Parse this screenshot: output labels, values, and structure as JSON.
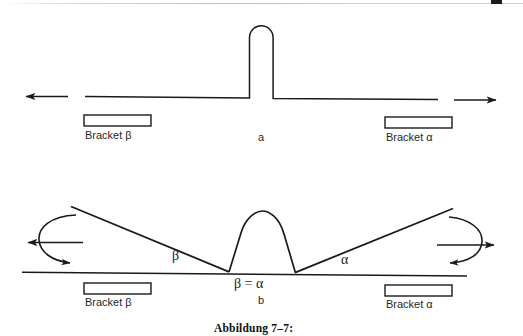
{
  "figure": {
    "caption": "Abbildung 7–7:",
    "panels": [
      {
        "id": "a",
        "letter": "a",
        "bracket_left_label": "Bracket β",
        "bracket_right_label": "Bracket α"
      },
      {
        "id": "b",
        "letter": "b",
        "bracket_left_label": "Bracket β",
        "bracket_right_label": "Bracket α",
        "angle_left_label": "β",
        "angle_right_label": "α",
        "equality_label": "β = α"
      }
    ],
    "colors": {
      "ink": "#1a1a1a",
      "paper": "#ffffff",
      "rule": "#bdbdbd"
    }
  }
}
